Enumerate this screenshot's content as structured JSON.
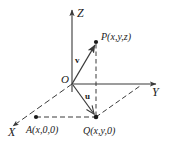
{
  "figure": {
    "kind": "3d-coordinate-system-diagram",
    "background_color": "#ffffff",
    "stroke_color": "#3a3a3a",
    "text_color": "#1a1a1a"
  },
  "axes": {
    "z_label": "Z",
    "y_label": "Y",
    "x_label": "X"
  },
  "origin": {
    "label": "O"
  },
  "points": {
    "p_label": "P(x,y,z)",
    "q_label": "Q(x,y,0)",
    "a_label": "A(x,0,0)"
  },
  "vectors": {
    "v_label": "v",
    "u_label": "u"
  }
}
